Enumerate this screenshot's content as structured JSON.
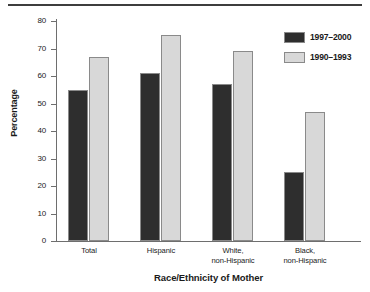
{
  "chart_data": {
    "type": "bar",
    "title": "",
    "xlabel": "Race/Ethnicity of Mother",
    "ylabel": "Percentage",
    "ylim": [
      0,
      80
    ],
    "yticks": [
      0,
      10,
      20,
      30,
      40,
      50,
      60,
      70,
      80
    ],
    "grid": false,
    "legend_position": "top-right",
    "categories": [
      "Total",
      "Hispanic",
      "White,\nnon-Hispanic",
      "Black,\nnon-Hispanic"
    ],
    "category_lines": [
      [
        "Total",
        ""
      ],
      [
        "Hispanic",
        ""
      ],
      [
        "White,",
        "non-Hispanic"
      ],
      [
        "Black,",
        "non-Hispanic"
      ]
    ],
    "series": [
      {
        "name": "1997–2000",
        "color": "#2e2e2e",
        "values": [
          55,
          61,
          57,
          25
        ]
      },
      {
        "name": "1990–1993",
        "color": "#d8d8d8",
        "values": [
          67,
          75,
          69,
          47
        ]
      }
    ]
  },
  "axis": {
    "tick_labels": [
      "80",
      "70",
      "60",
      "50",
      "40",
      "30",
      "20",
      "10",
      "0"
    ]
  }
}
